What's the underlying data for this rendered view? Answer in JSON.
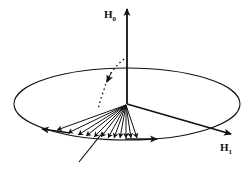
{
  "diagram": {
    "type": "spin-precession-vector-diagram",
    "colors": {
      "stroke": "#111111",
      "background": "#ffffff"
    },
    "axes": [
      {
        "id": "H0",
        "label": "H",
        "subscript": "0",
        "direction": "vertical-up"
      },
      {
        "id": "H1",
        "label": "H",
        "subscript": "1",
        "direction": "in-plane-right"
      }
    ],
    "ellipse": {
      "cx": 127,
      "cy": 104,
      "rx": 113,
      "ry": 36
    },
    "origin": {
      "x": 126,
      "y": 104
    },
    "fan_vector_count": 12,
    "elements": [
      "precession ellipse",
      "fan of magnetization vectors",
      "dotted rotation path",
      "circulation arrows on ellipse",
      "projection line"
    ]
  }
}
